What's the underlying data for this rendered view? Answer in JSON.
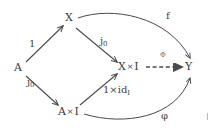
{
  "figure": {
    "type": "commutative-diagram",
    "background_color": "#ffffff",
    "ink_color": "#4a4a4a"
  },
  "nodes": [
    {
      "id": "A",
      "label": "A",
      "x": 18,
      "y": 68
    },
    {
      "id": "X",
      "label": "X",
      "x": 68,
      "y": 18
    },
    {
      "id": "AxI",
      "label": "A×I",
      "x": 62,
      "y": 112
    },
    {
      "id": "XxI",
      "label": "X×I",
      "x": 122,
      "y": 68
    },
    {
      "id": "Y",
      "label": "Y",
      "x": 188,
      "y": 68
    }
  ],
  "arrows": [
    {
      "id": "A-to-X",
      "from": "A",
      "to": "X",
      "label": "1",
      "sub": "",
      "style": "solid",
      "shape": "straight"
    },
    {
      "id": "A-to-AxI",
      "from": "A",
      "to": "AxI",
      "label": "j",
      "sub": "0",
      "style": "solid",
      "shape": "straight"
    },
    {
      "id": "X-to-XxI",
      "from": "X",
      "to": "XxI",
      "label": "j",
      "sub": "0",
      "style": "solid",
      "shape": "straight"
    },
    {
      "id": "AxI-to-XxI",
      "from": "AxI",
      "to": "XxI",
      "label": "1×id",
      "sub": "I",
      "style": "solid",
      "shape": "straight"
    },
    {
      "id": "XxI-to-Y",
      "from": "XxI",
      "to": "Y",
      "label": "Φ",
      "sub": "",
      "style": "dashed",
      "shape": "straight"
    },
    {
      "id": "X-to-Y",
      "from": "X",
      "to": "Y",
      "label": "f",
      "sub": "",
      "style": "solid",
      "shape": "curved"
    },
    {
      "id": "AxI-to-Y",
      "from": "AxI",
      "to": "Y",
      "label": "φ",
      "sub": "",
      "style": "solid",
      "shape": "curved"
    }
  ],
  "labels": {
    "one": "1",
    "j_base": "j",
    "j_sub": "0",
    "one_times_id_base": "1×id",
    "one_times_id_sub": "I",
    "f": "f",
    "phi": "φ",
    "capital_phi": "Φ",
    "node_A": "A",
    "node_X": "X",
    "node_AxI_base": "A",
    "node_AxI_times": "×",
    "node_AxI_tail": "I",
    "node_XxI_base": "X",
    "node_XxI_times": "×",
    "node_XxI_tail": "I",
    "node_Y": "Y"
  }
}
